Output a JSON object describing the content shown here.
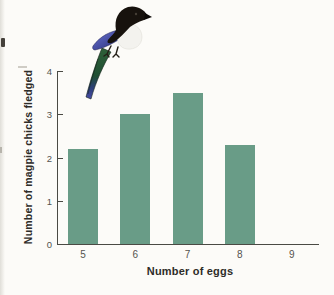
{
  "chart_data": {
    "type": "bar",
    "categories": [
      "5",
      "6",
      "7",
      "8",
      "9"
    ],
    "values": [
      2.2,
      3.0,
      3.5,
      2.3,
      0
    ],
    "title": "",
    "xlabel": "Number of eggs",
    "ylabel": "Number of magpie chicks fledged",
    "ylim": [
      0,
      4
    ],
    "yticks": [
      "0",
      "1",
      "2",
      "3",
      "4"
    ],
    "grid": false,
    "legend": "none",
    "bar_color": "#699c87",
    "axis_color": "#4a4a44",
    "tick_label_color": "#55534e",
    "background_color": "#fcfbf8"
  },
  "decorations": {
    "bird_icon": "magpie-image"
  }
}
